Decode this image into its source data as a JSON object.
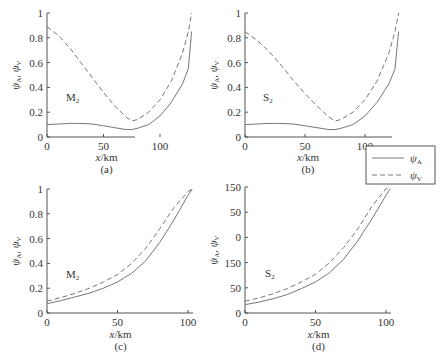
{
  "chart_data": [
    {
      "type": "line",
      "panel": "(a)",
      "annotation": "M2",
      "xlabel": "x/km",
      "ylabel": "ψA, ψV",
      "xlim": [
        0,
        128
      ],
      "ylim": [
        0,
        1
      ],
      "xticks": [
        "0",
        "50",
        "100"
      ],
      "yticks": [
        "0",
        "0.2",
        "0.4",
        "0.6",
        "0.8",
        "1"
      ],
      "x": [
        0,
        10,
        20,
        30,
        40,
        50,
        60,
        70,
        75,
        80,
        90,
        100,
        110,
        120,
        125,
        128
      ],
      "series": [
        {
          "name": "ψA",
          "style": "solid",
          "values": [
            0.1,
            0.105,
            0.11,
            0.11,
            0.105,
            0.09,
            0.075,
            0.06,
            0.06,
            0.07,
            0.1,
            0.17,
            0.28,
            0.43,
            0.55,
            0.85
          ]
        },
        {
          "name": "ψV",
          "style": "dashed",
          "values": [
            0.89,
            0.82,
            0.72,
            0.6,
            0.48,
            0.36,
            0.25,
            0.16,
            0.13,
            0.14,
            0.2,
            0.3,
            0.45,
            0.68,
            0.85,
            1.0
          ]
        }
      ]
    },
    {
      "type": "line",
      "panel": "(b)",
      "annotation": "S2",
      "xlabel": "x/km",
      "ylabel": "ψA, ψV",
      "xlim": [
        0,
        128
      ],
      "ylim": [
        0,
        1
      ],
      "xticks": [
        "0",
        "50",
        "100"
      ],
      "yticks": [
        "0",
        "0.2",
        "0.4",
        "0.6",
        "0.8",
        "1"
      ],
      "x": [
        0,
        10,
        20,
        30,
        40,
        50,
        60,
        70,
        75,
        80,
        90,
        100,
        110,
        120,
        125,
        128
      ],
      "series": [
        {
          "name": "ψA",
          "style": "solid",
          "values": [
            0.1,
            0.105,
            0.11,
            0.11,
            0.105,
            0.09,
            0.075,
            0.06,
            0.06,
            0.07,
            0.1,
            0.17,
            0.28,
            0.43,
            0.55,
            0.85
          ]
        },
        {
          "name": "ψV",
          "style": "dashed",
          "values": [
            0.85,
            0.78,
            0.69,
            0.58,
            0.46,
            0.35,
            0.25,
            0.16,
            0.13,
            0.14,
            0.2,
            0.3,
            0.45,
            0.68,
            0.85,
            1.0
          ]
        }
      ]
    },
    {
      "type": "line",
      "panel": "(c)",
      "annotation": "M2",
      "xlabel": "x/km",
      "ylabel": "ψA, ψV",
      "xlim": [
        0,
        103
      ],
      "ylim": [
        0,
        1
      ],
      "xticks": [
        "0",
        "50",
        "100"
      ],
      "yticks": [
        "0",
        "0.2",
        "0.4",
        "0.6",
        "0.8",
        "1"
      ],
      "x": [
        0,
        10,
        20,
        30,
        40,
        50,
        60,
        70,
        80,
        90,
        100,
        103
      ],
      "series": [
        {
          "name": "ψA",
          "style": "solid",
          "values": [
            0.075,
            0.1,
            0.13,
            0.16,
            0.2,
            0.25,
            0.32,
            0.42,
            0.57,
            0.75,
            0.95,
            1.0
          ]
        },
        {
          "name": "ψV",
          "style": "dashed",
          "values": [
            0.095,
            0.125,
            0.16,
            0.2,
            0.25,
            0.31,
            0.4,
            0.52,
            0.68,
            0.85,
            0.98,
            1.0
          ]
        }
      ]
    },
    {
      "type": "line",
      "panel": "(d)",
      "annotation": "S2",
      "xlabel": "x/km",
      "ylabel": "ψA, ψV",
      "xlim": [
        0,
        103
      ],
      "ylim": [
        0,
        150
      ],
      "xticks": [
        "0",
        "50",
        "100"
      ],
      "yticks": [
        "0",
        "50",
        "150",
        "0",
        "50",
        "150"
      ],
      "x": [
        0,
        10,
        20,
        30,
        40,
        50,
        60,
        70,
        80,
        90,
        100,
        103
      ],
      "series": [
        {
          "name": "ψA",
          "style": "solid",
          "values": [
            10,
            13,
            17,
            22,
            29,
            37,
            48,
            64,
            86,
            112,
            140,
            148
          ]
        },
        {
          "name": "ψV",
          "style": "dashed",
          "values": [
            14,
            18,
            23,
            29,
            37,
            46,
            60,
            78,
            100,
            127,
            148,
            150
          ]
        }
      ]
    }
  ],
  "legend": {
    "items": [
      {
        "label": "ψA",
        "style": "solid"
      },
      {
        "label": "ψV",
        "style": "dashed"
      }
    ]
  },
  "labels": {
    "xlabel_a": "x/km",
    "xlabel_b": "x/km",
    "xlabel_c": "x/km",
    "xlabel_d": "x/km",
    "panel_a": "(a)",
    "panel_b": "(b)",
    "panel_c": "(c)",
    "panel_d": "(d)",
    "anno_a": "M",
    "anno_b": "S",
    "anno_c": "M",
    "anno_d": "S",
    "anno_sub": "2",
    "ylab_main": "ψ",
    "ylab_sub_a": "A",
    "ylab_sep": ", ",
    "ylab_sub_v": "V",
    "legend_a": "ψ",
    "legend_a_sub": "A",
    "legend_v": "ψ",
    "legend_v_sub": "V"
  }
}
